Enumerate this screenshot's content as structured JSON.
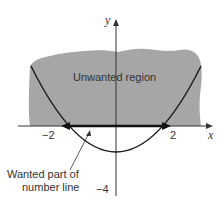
{
  "diagram": {
    "region_label": "Unwanted region",
    "annotation_line1": "Wanted part of",
    "annotation_line2": "number line",
    "x_axis_label": "x",
    "y_axis_label": "y",
    "tick_neg2": "−2",
    "tick_pos2": "2",
    "tick_neg4": "−4",
    "colors": {
      "region_fill": "#a6a6a6",
      "curve": "#1a1a1a",
      "axis": "#333333",
      "text": "#333333"
    },
    "curve": "y = x^2 - 4",
    "wanted_interval": [
      -2,
      2
    ]
  }
}
